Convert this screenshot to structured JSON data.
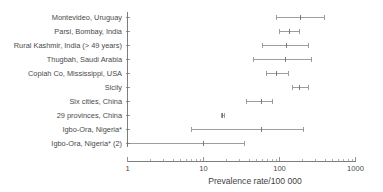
{
  "chart_data": {
    "type": "scatter",
    "subtype": "forest-plot",
    "title": "",
    "xlabel": "Prevalence rate/100 000",
    "ylabel": "",
    "xscale": "log",
    "xlim": [
      1,
      1000
    ],
    "xticks": [
      1,
      10,
      100,
      1000
    ],
    "xticklabels": [
      "1",
      "10",
      "100",
      "1000"
    ],
    "grid": false,
    "legend": null,
    "categories": [
      "Montevideo, Uruguay",
      "Parsi, Bombay, India",
      "Rural Kashmir, India (> 49 years)",
      "Thugbah, Saudi Arabia",
      "Copiah Co, Mississippi, USA",
      "Sicily",
      "Six cities, China",
      "29 provinces, China",
      "Igbo-Ora, Nigeria*",
      "Igbo-Ora, Nigeria* (2)"
    ],
    "points": [
      {
        "label": "Montevideo, Uruguay",
        "value": 190,
        "low": 90,
        "high": 390
      },
      {
        "label": "Parsi, Bombay, India",
        "value": 135,
        "low": 100,
        "high": 185
      },
      {
        "label": "Rural Kashmir, India (> 49 years)",
        "value": 125,
        "low": 60,
        "high": 240
      },
      {
        "label": "Thugbah, Saudi Arabia",
        "value": 120,
        "low": 46,
        "high": 265
      },
      {
        "label": "Copiah Co, Mississippi, USA",
        "value": 90,
        "low": 68,
        "high": 130
      },
      {
        "label": "Sicily",
        "value": 185,
        "low": 150,
        "high": 240
      },
      {
        "label": "Six cities, China",
        "value": 58,
        "low": 37,
        "high": 82
      },
      {
        "label": "29 provinces, China",
        "value": 18,
        "low": 17,
        "high": 19
      },
      {
        "label": "Igbo-Ora, Nigeria*",
        "value": 58,
        "low": 7,
        "high": 210
      },
      {
        "label": "Igbo-Ora, Nigeria* (2)",
        "value": 10,
        "low": 1,
        "high": 35
      }
    ]
  },
  "axis": {
    "x_title": "Prevalence rate/100 000"
  },
  "colors": {
    "line": "#8d8d8d",
    "text": "#4a4a4a",
    "axis": "#6f6f6f",
    "background": "#ffffff"
  }
}
